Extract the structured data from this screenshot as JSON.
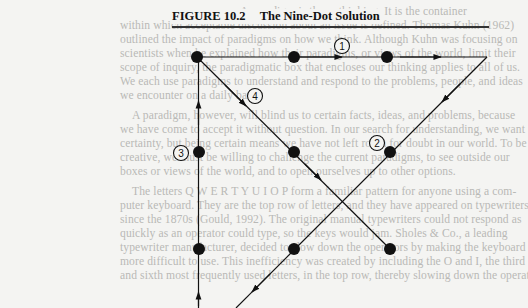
{
  "figure": {
    "number": "FIGURE 10.2",
    "title": "The Nine-Dot Solution",
    "steps": [
      {
        "label": "1",
        "x": 342,
        "y": 46
      },
      {
        "label": "2",
        "x": 377,
        "y": 143
      },
      {
        "label": "3",
        "x": 181,
        "y": 153
      },
      {
        "label": "4",
        "x": 255,
        "y": 96
      }
    ],
    "dots": [
      {
        "x": 197,
        "y": 57
      },
      {
        "x": 294,
        "y": 57
      },
      {
        "x": 387,
        "y": 57
      },
      {
        "x": 199,
        "y": 152
      },
      {
        "x": 294,
        "y": 152
      },
      {
        "x": 390,
        "y": 152
      },
      {
        "x": 199,
        "y": 249
      },
      {
        "x": 294,
        "y": 249
      },
      {
        "x": 390,
        "y": 249
      }
    ],
    "colors": {
      "ink": "#111111",
      "page": "#f4f4f2",
      "bleed_text": "#b9b9b6"
    }
  },
  "body_text": {
    "lines": [
      {
        "y": 12,
        "text": "A paradigm is the ... thinking. It is the container"
      },
      {
        "y": 26,
        "text": "within which acceptable discussion about an issue is defined. Thomas Kuhn (1962)"
      },
      {
        "y": 40,
        "text": "outlined the impact of paradigms on how we think. Although Kuhn was focusing on"
      },
      {
        "y": 54,
        "text": "scientists when he explained how their paradigms, or views of the world, limit their"
      },
      {
        "y": 68,
        "text": "scope of inquiry, the paradigmatic box that encloses our thinking applies to all of us."
      },
      {
        "y": 82,
        "text": "We each use paradigms to understand and respond to the problems, people, and ideas"
      },
      {
        "y": 96,
        "text": "we encounter on a daily basis."
      },
      {
        "y": 116,
        "text": "A paradigm, however, will blind us to certain facts, ideas, and problems, because"
      },
      {
        "y": 130,
        "text": "we have come to accept it without question. In our search for understanding, we want"
      },
      {
        "y": 144,
        "text": "certainty, but being certain means we have not left room for doubt in our world. To be"
      },
      {
        "y": 158,
        "text": "creative, we must be willing to challenge the current paradigms, to see outside our"
      },
      {
        "y": 172,
        "text": "boxes or views of the world, and to open ourselves up to other options."
      },
      {
        "y": 192,
        "text": "The letters Q W E R T Y U I O P form a familiar pattern for anyone using a com-"
      },
      {
        "y": 206,
        "text": "puter keyboard. They are the top row of letters, and they have appeared on typewriters"
      },
      {
        "y": 220,
        "text": "since the 1870s (Gould, 1992). The original manual typewriters could not respond as"
      },
      {
        "y": 234,
        "text": "quickly as an operator could type, so the keys would jam. Sholes & Co., a leading"
      },
      {
        "y": 248,
        "text": "typewriter manufacturer, decided to slow down the operators by making the keyboard"
      },
      {
        "y": 262,
        "text": "more difficult to use. This inefficiency was created by including the O and I, the third"
      },
      {
        "y": 276,
        "text": "and sixth most frequently used letters, in the top row, thereby slowing down the operator"
      }
    ]
  }
}
